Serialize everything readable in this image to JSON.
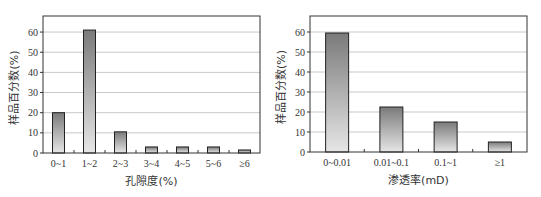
{
  "chart_data": [
    {
      "type": "bar",
      "title": "",
      "xlabel": "孔隙度(%)",
      "ylabel": "样品百分数(%)",
      "categories": [
        "0~1",
        "1~2",
        "2~3",
        "3~4",
        "4~5",
        "5~6",
        "≥6"
      ],
      "values": [
        20,
        61,
        10.5,
        3,
        3,
        3,
        1.5
      ],
      "ylim": [
        0,
        65
      ],
      "yticks": [
        0,
        10,
        20,
        30,
        40,
        50,
        60
      ],
      "grid": true,
      "legend": null
    },
    {
      "type": "bar",
      "title": "",
      "xlabel": "渗透率(mD)",
      "ylabel": "样品百分数(%)",
      "categories": [
        "0~0.01",
        "0.01~0.1",
        "0.1~1",
        "≥1"
      ],
      "values": [
        59.5,
        22.5,
        15,
        5
      ],
      "ylim": [
        0,
        65
      ],
      "yticks": [
        0,
        10,
        20,
        30,
        40,
        50,
        60
      ],
      "grid": true,
      "legend": null
    }
  ],
  "style": {
    "bar_top_color": "#7a7a7a",
    "bar_bottom_color": "#e6e6e6",
    "bar_stroke": "#222222",
    "grid_color": "#c8c8c8",
    "axis_color": "#333333"
  }
}
